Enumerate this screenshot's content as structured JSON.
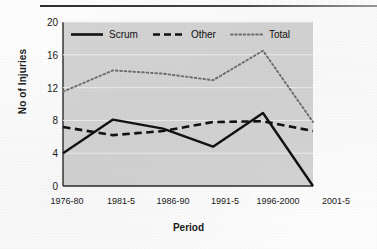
{
  "figure": {
    "has_top_rule": true,
    "plot_background": "#d4d4d4",
    "gridline_color": "#efefef"
  },
  "legend": {
    "position": "top-inside",
    "entries": [
      {
        "label": "Scrum",
        "style": "solid",
        "color": "#111111"
      },
      {
        "label": "Other",
        "style": "dashed",
        "color": "#111111"
      },
      {
        "label": "Total",
        "style": "dotted",
        "color": "#6e6e6e"
      }
    ]
  },
  "axes": {
    "xlabel": "Period",
    "ylabel": "No of Injuries",
    "yticks": [
      "20",
      "16",
      "12",
      "8",
      "4",
      "0"
    ],
    "xticks": [
      "1976-80",
      "1981-5",
      "1986-90",
      "1991-5",
      "1996-2000",
      "2001-5"
    ]
  },
  "chart_data": {
    "type": "line",
    "title": "",
    "xlabel": "Period",
    "ylabel": "No of Injuries",
    "categories": [
      "1976-80",
      "1981-5",
      "1986-90",
      "1991-5",
      "1996-2000",
      "2001-5"
    ],
    "ylim": [
      0,
      20
    ],
    "ytick_step": 4,
    "grid": true,
    "legend_position": "top-inside",
    "series": [
      {
        "name": "Scrum",
        "style": "solid",
        "color": "#111111",
        "values": [
          4.0,
          8.1,
          7.0,
          4.8,
          8.9,
          0.0
        ]
      },
      {
        "name": "Other",
        "style": "dashed",
        "color": "#111111",
        "values": [
          7.2,
          6.2,
          6.7,
          7.8,
          7.9,
          6.7
        ]
      },
      {
        "name": "Total",
        "style": "dotted",
        "color": "#6e6e6e",
        "values": [
          11.5,
          14.1,
          13.7,
          12.9,
          16.5,
          7.8
        ]
      }
    ]
  }
}
